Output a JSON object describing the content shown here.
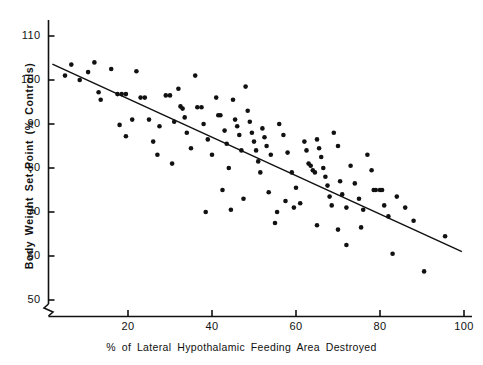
{
  "chart_data": {
    "type": "scatter",
    "title": "",
    "xlabel": "% of Lateral Hypothalamic Feeding Area Destroyed",
    "ylabel": "Body Weight Set-Point (% Controls)",
    "xlim": [
      0,
      100
    ],
    "ylim": [
      45,
      113
    ],
    "grid": false,
    "legend": null,
    "axis_break_y": true,
    "xticks": [
      20,
      40,
      60,
      80,
      100
    ],
    "xtick_labels": [
      "20",
      "40",
      "60",
      "80",
      "100"
    ],
    "yticks": [
      50,
      60,
      70,
      80,
      90,
      100,
      110
    ],
    "ytick_labels": [
      "50",
      "60",
      "70",
      "80",
      "90",
      "100",
      "110"
    ],
    "marker": "filled-circle",
    "marker_color": "#111111",
    "marker_size_px": 4.6,
    "trendline": {
      "label": "regression line",
      "color": "#111111",
      "x_start": 2.0,
      "y_start": 103.6,
      "x_end": 99.5,
      "y_end": 61.0
    },
    "points": [
      [
        5.0,
        101.0
      ],
      [
        6.5,
        103.5
      ],
      [
        8.5,
        100.0
      ],
      [
        10.5,
        101.8
      ],
      [
        12.0,
        104.0
      ],
      [
        13.0,
        97.2
      ],
      [
        13.5,
        95.5
      ],
      [
        16.0,
        102.5
      ],
      [
        17.5,
        96.8
      ],
      [
        18.5,
        96.8
      ],
      [
        19.5,
        96.8
      ],
      [
        18.0,
        89.8
      ],
      [
        19.5,
        87.2
      ],
      [
        22.0,
        102.0
      ],
      [
        23.0,
        96.0
      ],
      [
        24.0,
        96.0
      ],
      [
        25.0,
        91.0
      ],
      [
        26.0,
        86.0
      ],
      [
        27.0,
        83.0
      ],
      [
        29.0,
        96.5
      ],
      [
        30.0,
        96.5
      ],
      [
        31.0,
        90.5
      ],
      [
        32.0,
        98.0
      ],
      [
        32.5,
        94.0
      ],
      [
        33.0,
        93.5
      ],
      [
        33.5,
        91.5
      ],
      [
        34.0,
        88.0
      ],
      [
        35.0,
        84.5
      ],
      [
        36.0,
        101.0
      ],
      [
        36.5,
        93.8
      ],
      [
        37.5,
        93.8
      ],
      [
        38.0,
        90.0
      ],
      [
        39.0,
        86.5
      ],
      [
        40.0,
        83.0
      ],
      [
        41.0,
        96.0
      ],
      [
        41.5,
        92.0
      ],
      [
        42.0,
        92.0
      ],
      [
        43.0,
        88.5
      ],
      [
        43.5,
        85.5
      ],
      [
        44.0,
        80.0
      ],
      [
        45.0,
        95.5
      ],
      [
        45.5,
        91.0
      ],
      [
        46.0,
        89.5
      ],
      [
        46.5,
        87.5
      ],
      [
        47.0,
        84.0
      ],
      [
        48.0,
        98.5
      ],
      [
        48.5,
        93.0
      ],
      [
        49.0,
        90.5
      ],
      [
        49.5,
        88.0
      ],
      [
        50.0,
        86.0
      ],
      [
        50.5,
        84.0
      ],
      [
        51.0,
        81.5
      ],
      [
        51.5,
        79.0
      ],
      [
        52.0,
        89.0
      ],
      [
        52.5,
        87.0
      ],
      [
        53.0,
        85.0
      ],
      [
        54.0,
        83.0
      ],
      [
        55.0,
        67.5
      ],
      [
        56.0,
        90.0
      ],
      [
        57.0,
        87.5
      ],
      [
        58.0,
        83.5
      ],
      [
        59.0,
        79.0
      ],
      [
        60.0,
        75.5
      ],
      [
        61.0,
        72.0
      ],
      [
        62.0,
        86.0
      ],
      [
        62.5,
        84.0
      ],
      [
        63.0,
        81.0
      ],
      [
        63.5,
        80.5
      ],
      [
        64.0,
        79.5
      ],
      [
        64.5,
        79.0
      ],
      [
        65.0,
        86.5
      ],
      [
        65.5,
        84.5
      ],
      [
        66.0,
        82.5
      ],
      [
        66.5,
        80.0
      ],
      [
        67.0,
        78.0
      ],
      [
        67.5,
        76.0
      ],
      [
        68.0,
        73.5
      ],
      [
        68.5,
        71.5
      ],
      [
        69.0,
        88.0
      ],
      [
        70.0,
        85.0
      ],
      [
        70.5,
        77.0
      ],
      [
        71.0,
        74.0
      ],
      [
        72.0,
        71.0
      ],
      [
        73.0,
        80.5
      ],
      [
        74.0,
        76.5
      ],
      [
        75.0,
        73.0
      ],
      [
        76.0,
        70.5
      ],
      [
        77.0,
        83.0
      ],
      [
        78.0,
        79.5
      ],
      [
        78.5,
        75.0
      ],
      [
        79.0,
        75.0
      ],
      [
        80.0,
        75.0
      ],
      [
        80.5,
        75.0
      ],
      [
        81.0,
        71.5
      ],
      [
        82.0,
        69.0
      ],
      [
        83.0,
        60.5
      ],
      [
        84.0,
        73.5
      ],
      [
        86.0,
        71.0
      ],
      [
        88.0,
        68.0
      ],
      [
        72.0,
        62.5
      ],
      [
        75.5,
        66.5
      ],
      [
        90.5,
        56.5
      ],
      [
        57.5,
        72.5
      ],
      [
        59.5,
        71.0
      ],
      [
        44.5,
        70.5
      ],
      [
        38.5,
        70.0
      ],
      [
        30.5,
        81.0
      ],
      [
        27.5,
        89.5
      ],
      [
        21.0,
        91.0
      ],
      [
        53.5,
        74.5
      ],
      [
        55.5,
        70.0
      ],
      [
        65.0,
        67.0
      ],
      [
        95.5,
        64.5
      ],
      [
        70.0,
        66.0
      ],
      [
        42.5,
        75.0
      ],
      [
        47.5,
        73.0
      ]
    ]
  },
  "axis": {
    "x_title": "% of Lateral Hypothalamic Feeding Area Destroyed",
    "y_title": "Body Weight Set-Point (% Controls)"
  }
}
